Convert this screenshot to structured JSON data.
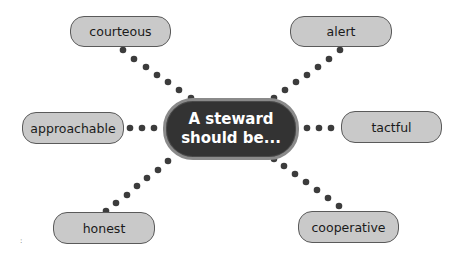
{
  "center": {
    "line1": "A steward",
    "line2": "should be..."
  },
  "nodes": {
    "courteous": "courteous",
    "alert": "alert",
    "approachable": "approachable",
    "tactful": "tactful",
    "honest": "honest",
    "cooperative": "cooperative"
  },
  "colors": {
    "node_fill": "#c9c9c9",
    "node_border": "#5a5a5a",
    "center_fill": "#333333",
    "center_border": "#8a8a8a",
    "dot": "#3c3c3c"
  },
  "footer_mark": ":"
}
